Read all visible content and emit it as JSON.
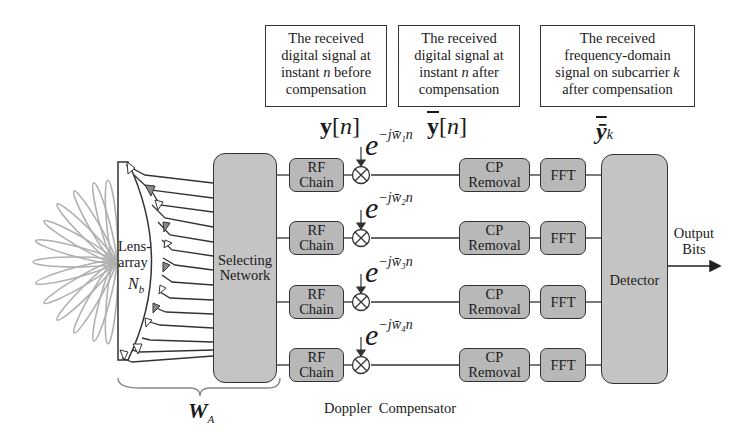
{
  "annotations": {
    "before": {
      "lines": [
        "The received",
        "digital signal at",
        "instant n before",
        "compensation"
      ]
    },
    "after": {
      "lines": [
        "The received",
        "digital signal at",
        "instant n after",
        "compensation"
      ]
    },
    "freq": {
      "lines": [
        "The received",
        "frequency-domain",
        "signal on subcarrier k",
        "after compensation"
      ]
    }
  },
  "symbols": {
    "y_n": "y[n]",
    "ybar_n": "ȳ[n]",
    "ybar_k": "ȳ",
    "ybar_k_sub": "k",
    "W_A": "W",
    "W_A_sub": "A"
  },
  "lens": {
    "label_line1": "Lens-",
    "label_line2": "array",
    "N": "N",
    "N_sub": "b"
  },
  "selecting_network": {
    "line1": "Selecting",
    "line2": "Network"
  },
  "detector": {
    "label": "Detector"
  },
  "output": {
    "line1": "Output",
    "line2": "Bits"
  },
  "doppler_label": "Doppler  Compensator",
  "rows": [
    {
      "rf1": "RF",
      "rf2": "Chain",
      "exp_base": "e",
      "exp_sup": "−jw̄₁n",
      "cp1": "CP",
      "cp2": "Removal",
      "fft": "FFT"
    },
    {
      "rf1": "RF",
      "rf2": "Chain",
      "exp_base": "e",
      "exp_sup": "−jw̄₂n",
      "cp1": "CP",
      "cp2": "Removal",
      "fft": "FFT"
    },
    {
      "rf1": "RF",
      "rf2": "Chain",
      "exp_base": "e",
      "exp_sup": "−jw̄₃n",
      "cp1": "CP",
      "cp2": "Removal",
      "fft": "FFT"
    },
    {
      "rf1": "RF",
      "rf2": "Chain",
      "exp_base": "e",
      "exp_sup": "−jw̄₄n",
      "cp1": "CP",
      "cp2": "Removal",
      "fft": "FFT"
    }
  ],
  "colors": {
    "block_fill": "#b8b8b8",
    "big_block_fill": "#c4c4c4",
    "stroke": "#333333",
    "beam": "#aaaaaa"
  }
}
